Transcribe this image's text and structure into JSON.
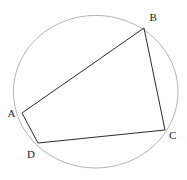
{
  "figure": {
    "type": "geometry-diagram",
    "background_color": "#ffffff",
    "circle": {
      "cx": 95.7,
      "cy": 91.7,
      "rx": 82.3,
      "ry": 76.3,
      "stroke_color": "#9e9e9e",
      "stroke_width": 0.8
    },
    "quadrilateral": {
      "stroke_color": "#2b2b2b",
      "stroke_width": 1,
      "vertices": [
        {
          "id": "A",
          "x": 22,
          "y": 113
        },
        {
          "id": "B",
          "x": 144,
          "y": 28
        },
        {
          "id": "C",
          "x": 165,
          "y": 130
        },
        {
          "id": "D",
          "x": 38,
          "y": 143
        }
      ]
    },
    "labels": [
      {
        "text": "A",
        "x": 7.5,
        "y": 117
      },
      {
        "text": "B",
        "x": 149.5,
        "y": 21
      },
      {
        "text": "C",
        "x": 169,
        "y": 139
      },
      {
        "text": "D",
        "x": 27,
        "y": 158
      }
    ]
  }
}
